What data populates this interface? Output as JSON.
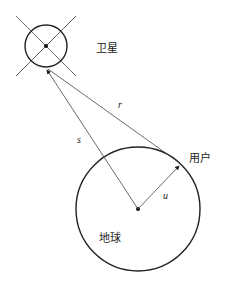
{
  "diagram": {
    "type": "geometry",
    "satellite": {
      "label": "卫星",
      "center": [
        46,
        46
      ],
      "radius": 24
    },
    "earth": {
      "label": "地球",
      "center": [
        138,
        209
      ],
      "radius": 62
    },
    "user": {
      "label": "用户",
      "point": [
        180,
        164
      ]
    },
    "vectors": [
      {
        "name": "s",
        "label": "s",
        "from": [
          138,
          209
        ],
        "to": [
          46,
          70
        ]
      },
      {
        "name": "r",
        "label": "r",
        "from": [
          180,
          164
        ],
        "to": [
          46,
          70
        ]
      },
      {
        "name": "u",
        "label": "u",
        "from": [
          138,
          209
        ],
        "to": [
          180,
          164
        ]
      }
    ],
    "colors": {
      "stroke": "#222222",
      "thin": "#444444"
    }
  }
}
